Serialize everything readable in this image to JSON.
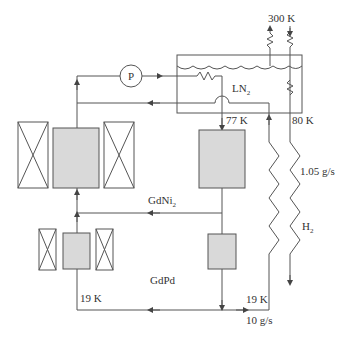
{
  "colors": {
    "line": "#555555",
    "bed_fill": "#d9d9d9",
    "background": "#ffffff"
  },
  "labels": {
    "pump": "P",
    "ln2_main": "LN",
    "ln2_sub": "2",
    "t_300": "300 K",
    "t_77": "77 K",
    "t_80": "80 K",
    "flow_h2": "1.05 g/s",
    "h2_main": "H",
    "h2_sub": "2",
    "gdni2_main": "GdNi",
    "gdni2_sub": "2",
    "gdpd": "GdPd",
    "t_19_left": "19 K",
    "t_19_right": "19 K",
    "flow_he": "10 g/s"
  }
}
